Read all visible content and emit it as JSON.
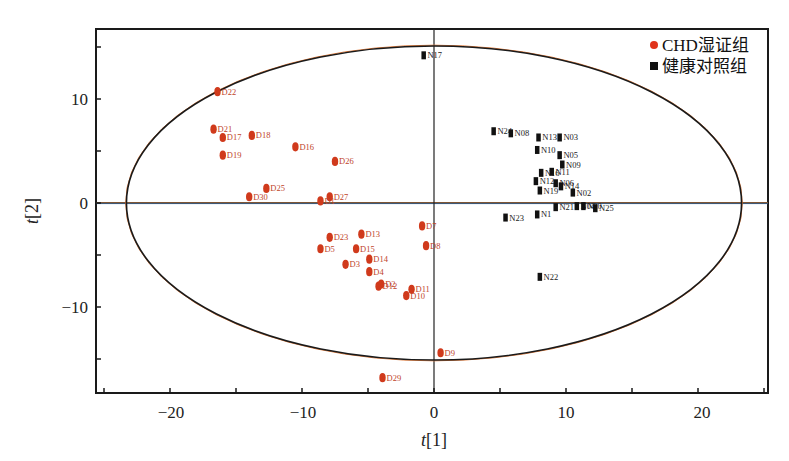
{
  "chart_data": {
    "type": "scatter",
    "title": "",
    "xlabel": "t[1]",
    "ylabel": "t[2]",
    "xlim": [
      -25.8,
      25.2
    ],
    "ylim": [
      -18.2,
      16.7
    ],
    "xticks": [
      -20,
      -10,
      0,
      10,
      20
    ],
    "yticks": [
      -10,
      0,
      10
    ],
    "x_minor_step": 5,
    "y_minor_step": 5,
    "grid": false,
    "legend_position": "upper right",
    "ellipse": {
      "cx": 0,
      "cy": 0,
      "rx": 23.3,
      "ry": 15.1,
      "label": "Hotelling T2 95%"
    },
    "series": [
      {
        "name": "CHD湿证组",
        "marker": "circle",
        "color": "#d03a1c",
        "points": [
          {
            "label": "D22",
            "x": -16.4,
            "y": 10.7
          },
          {
            "label": "D21",
            "x": -16.7,
            "y": 7.1
          },
          {
            "label": "D17",
            "x": -16.0,
            "y": 6.3
          },
          {
            "label": "D18",
            "x": -13.8,
            "y": 6.5
          },
          {
            "label": "D19",
            "x": -16.0,
            "y": 4.6
          },
          {
            "label": "D16",
            "x": -10.5,
            "y": 5.4
          },
          {
            "label": "D26",
            "x": -7.5,
            "y": 4.0
          },
          {
            "label": "D25",
            "x": -12.7,
            "y": 1.4
          },
          {
            "label": "D30",
            "x": -14.0,
            "y": 0.6
          },
          {
            "label": "D27",
            "x": -7.9,
            "y": 0.6
          },
          {
            "label": "D1",
            "x": -8.6,
            "y": 0.2
          },
          {
            "label": "D23",
            "x": -7.9,
            "y": -3.3
          },
          {
            "label": "D13",
            "x": -5.5,
            "y": -3.0
          },
          {
            "label": "D5",
            "x": -8.6,
            "y": -4.4
          },
          {
            "label": "D15",
            "x": -5.9,
            "y": -4.4
          },
          {
            "label": "D14",
            "x": -4.9,
            "y": -5.4
          },
          {
            "label": "D3",
            "x": -6.7,
            "y": -5.9
          },
          {
            "label": "D4",
            "x": -4.9,
            "y": -6.6
          },
          {
            "label": "D12",
            "x": -4.2,
            "y": -8.0
          },
          {
            "label": "D2",
            "x": -4.0,
            "y": -7.8
          },
          {
            "label": "D11",
            "x": -1.7,
            "y": -8.3
          },
          {
            "label": "D10",
            "x": -2.1,
            "y": -8.9
          },
          {
            "label": "D7",
            "x": -0.9,
            "y": -2.2
          },
          {
            "label": "D8",
            "x": -0.6,
            "y": -4.1
          },
          {
            "label": "D9",
            "x": 0.5,
            "y": -14.4
          },
          {
            "label": "D29",
            "x": -3.9,
            "y": -16.8
          }
        ]
      },
      {
        "name": "健康对照组",
        "marker": "square",
        "color": "#111111",
        "points": [
          {
            "label": "N17",
            "x": -0.8,
            "y": 14.2
          },
          {
            "label": "N24",
            "x": 4.5,
            "y": 6.9
          },
          {
            "label": "N08",
            "x": 5.8,
            "y": 6.7
          },
          {
            "label": "N13",
            "x": 7.9,
            "y": 6.3
          },
          {
            "label": "N03",
            "x": 9.5,
            "y": 6.3
          },
          {
            "label": "N10",
            "x": 7.8,
            "y": 5.1
          },
          {
            "label": "N05",
            "x": 9.5,
            "y": 4.6
          },
          {
            "label": "N09",
            "x": 9.7,
            "y": 3.7
          },
          {
            "label": "N11",
            "x": 8.9,
            "y": 3.0
          },
          {
            "label": "N16",
            "x": 8.1,
            "y": 2.9
          },
          {
            "label": "N12",
            "x": 7.7,
            "y": 2.1
          },
          {
            "label": "N06",
            "x": 9.2,
            "y": 1.9
          },
          {
            "label": "N14",
            "x": 9.6,
            "y": 1.6
          },
          {
            "label": "N02",
            "x": 10.5,
            "y": 1.0
          },
          {
            "label": "N19",
            "x": 8.0,
            "y": 1.2
          },
          {
            "label": "N21",
            "x": 9.2,
            "y": -0.4
          },
          {
            "label": "N04",
            "x": 10.8,
            "y": -0.3
          },
          {
            "label": "N20",
            "x": 11.3,
            "y": -0.3
          },
          {
            "label": "N25",
            "x": 12.2,
            "y": -0.5
          },
          {
            "label": "N1",
            "x": 7.8,
            "y": -1.1
          },
          {
            "label": "N23",
            "x": 5.4,
            "y": -1.4
          },
          {
            "label": "N22",
            "x": 8.0,
            "y": -7.1
          }
        ]
      }
    ]
  },
  "legend": {
    "items": [
      {
        "label": "CHD湿证组",
        "color": "#e0341c",
        "marker": "circle"
      },
      {
        "label": "健康对照组",
        "color": "#111111",
        "marker": "square"
      }
    ]
  },
  "axes": {
    "x_title_italic": "t",
    "x_title_rest": "[1]",
    "y_title_italic": "t",
    "y_title_rest": "[2]",
    "x_tick_labels": [
      "−20",
      "−10",
      "0",
      "10",
      "20"
    ],
    "y_tick_labels": [
      "10",
      "0",
      "−10"
    ]
  }
}
